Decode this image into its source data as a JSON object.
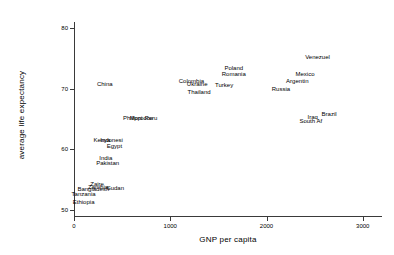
{
  "chart_data": {
    "type": "scatter",
    "title": "",
    "xlabel": "GNP per capita",
    "ylabel": "average life expectancy",
    "xlim": [
      0,
      3200
    ],
    "ylim": [
      49,
      81
    ],
    "xticks": [
      0,
      1000,
      2000,
      3000
    ],
    "yticks": [
      50,
      60,
      70,
      80
    ],
    "xtick_labels": [
      "0",
      "1000",
      "2000",
      "3000"
    ],
    "ytick_labels": [
      "50",
      "60",
      "70",
      "80"
    ],
    "grid": false,
    "legend": "none",
    "marker": "text-label",
    "points": [
      {
        "label": "Ethiopia",
        "x": 100,
        "y": 51.3
      },
      {
        "label": "Tanzania",
        "x": 100,
        "y": 52.6
      },
      {
        "label": "Bangladesh",
        "x": 200,
        "y": 53.5
      },
      {
        "label": "Zaire",
        "x": 240,
        "y": 54.2
      },
      {
        "label": "Zambia",
        "x": 250,
        "y": 53.8
      },
      {
        "label": "Sudan",
        "x": 430,
        "y": 53.6
      },
      {
        "label": "India",
        "x": 330,
        "y": 58.6
      },
      {
        "label": "Pakistan",
        "x": 350,
        "y": 57.7
      },
      {
        "label": "Kenya",
        "x": 290,
        "y": 61.5
      },
      {
        "label": "Indonesi",
        "x": 390,
        "y": 61.5
      },
      {
        "label": "Egypt",
        "x": 420,
        "y": 60.6
      },
      {
        "label": "Philippi",
        "x": 610,
        "y": 65.1
      },
      {
        "label": "Morocco",
        "x": 700,
        "y": 65.1
      },
      {
        "label": "Peru",
        "x": 800,
        "y": 65.1
      },
      {
        "label": "China",
        "x": 320,
        "y": 70.8
      },
      {
        "label": "Thailand",
        "x": 1300,
        "y": 69.4
      },
      {
        "label": "Colombia",
        "x": 1220,
        "y": 71.3
      },
      {
        "label": "Ukraine",
        "x": 1280,
        "y": 70.7
      },
      {
        "label": "Turkey",
        "x": 1560,
        "y": 70.6
      },
      {
        "label": "Romania",
        "x": 1660,
        "y": 72.4
      },
      {
        "label": "Poland",
        "x": 1660,
        "y": 73.4
      },
      {
        "label": "Russia",
        "x": 2150,
        "y": 69.9
      },
      {
        "label": "Argentin",
        "x": 2320,
        "y": 71.3
      },
      {
        "label": "Mexico",
        "x": 2400,
        "y": 72.4
      },
      {
        "label": "Venezuel",
        "x": 2530,
        "y": 75.2
      },
      {
        "label": "Iraq",
        "x": 2480,
        "y": 65.3
      },
      {
        "label": "South Af",
        "x": 2460,
        "y": 64.7
      },
      {
        "label": "Brazil",
        "x": 2650,
        "y": 65.8
      }
    ]
  },
  "axes": {
    "x_title": "GNP per capita",
    "y_title": "average life expectancy"
  }
}
